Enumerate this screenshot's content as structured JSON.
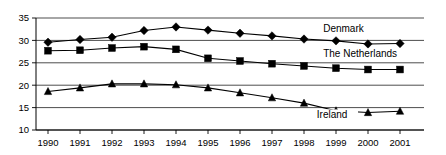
{
  "chart_data": {
    "type": "line",
    "title": "",
    "xlabel": "",
    "ylabel": "",
    "categories": [
      "1990",
      "1991",
      "1992",
      "1993",
      "1994",
      "1995",
      "1996",
      "1997",
      "1998",
      "1999",
      "2000",
      "2001"
    ],
    "x": [
      1990,
      1991,
      1992,
      1993,
      1994,
      1995,
      1996,
      1997,
      1998,
      1999,
      2000,
      2001
    ],
    "ylim": [
      10,
      35
    ],
    "yticks": [
      10,
      15,
      20,
      25,
      30,
      35
    ],
    "ytick_labels": [
      "10",
      "15",
      "20",
      "25",
      "30",
      "35"
    ],
    "grid": "horizontal",
    "legend_position": "inline-right",
    "series": [
      {
        "name": "Denmark",
        "marker": "diamond",
        "color": "#000000",
        "values": [
          29.6,
          30.2,
          30.7,
          32.2,
          33.0,
          32.3,
          31.6,
          31.0,
          30.3,
          29.9,
          29.2,
          29.3
        ]
      },
      {
        "name": "The Netherlands",
        "marker": "square",
        "color": "#000000",
        "values": [
          27.7,
          27.8,
          28.3,
          28.6,
          28.0,
          26.0,
          25.4,
          24.8,
          24.3,
          23.8,
          23.5,
          23.5
        ]
      },
      {
        "name": "Ireland",
        "marker": "triangle",
        "color": "#000000",
        "values": [
          18.6,
          19.4,
          20.3,
          20.3,
          20.1,
          19.4,
          18.3,
          17.2,
          16.0,
          14.3,
          13.9,
          14.2
        ]
      }
    ],
    "annotations": [
      {
        "text": "Denmark",
        "x": 1998.6,
        "y": 31.9
      },
      {
        "text": "The Netherlands",
        "x": 1998.6,
        "y": 26.3
      },
      {
        "text": "Ireland",
        "x": 1998.4,
        "y": 12.7
      }
    ]
  }
}
